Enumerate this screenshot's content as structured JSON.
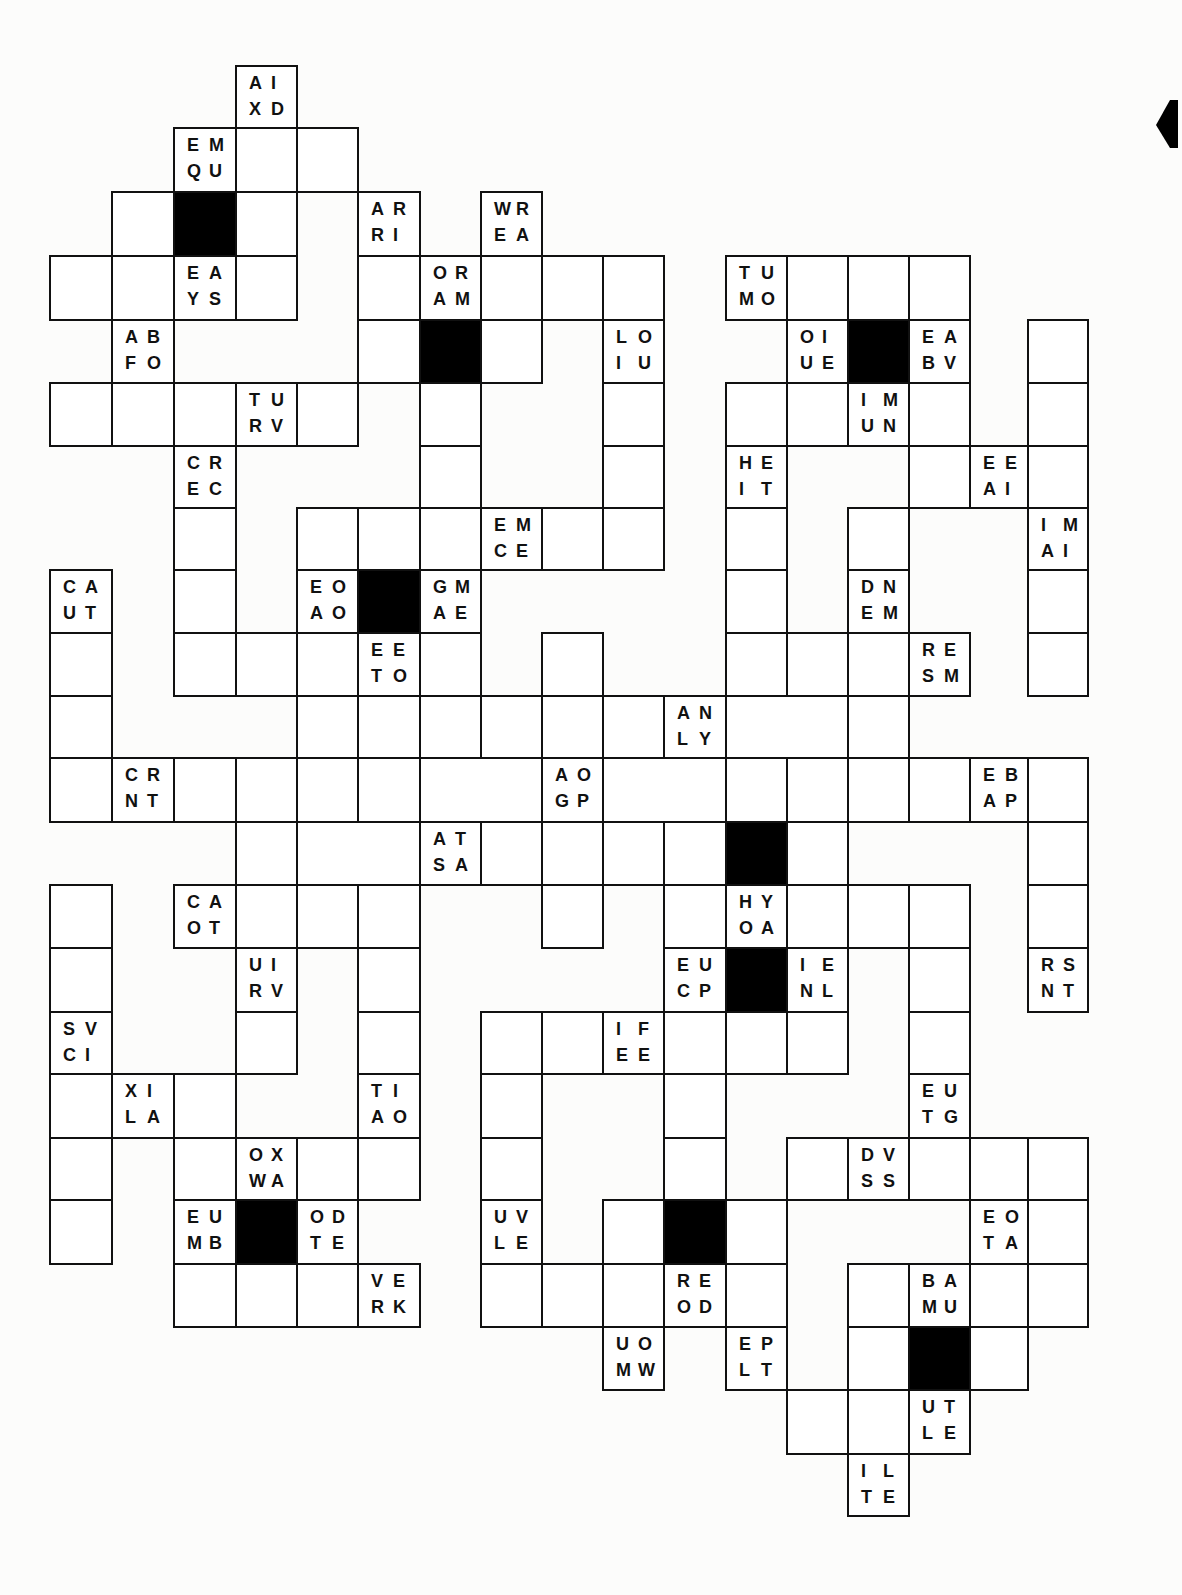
{
  "puzzle": {
    "colLines": [
      50,
      112,
      174,
      236,
      297,
      358,
      420,
      481,
      542,
      603,
      664,
      726,
      787,
      848,
      909,
      970,
      1028,
      1088
    ],
    "rowLines": [
      66,
      128,
      192,
      256,
      320,
      383,
      446,
      508,
      570,
      633,
      696,
      758,
      822,
      885,
      948,
      1012,
      1074,
      1138,
      1200,
      1264,
      1327,
      1390,
      1454,
      1516
    ],
    "cells": [
      {
        "c": 3,
        "r": 0,
        "t": "AIXD"
      },
      {
        "c": 2,
        "r": 1,
        "t": "EMQU"
      },
      {
        "c": 3,
        "r": 1
      },
      {
        "c": 4,
        "r": 1
      },
      {
        "c": 1,
        "r": 2
      },
      {
        "c": 2,
        "r": 2,
        "b": 1
      },
      {
        "c": 3,
        "r": 2
      },
      {
        "c": 5,
        "r": 2,
        "t": "ARRI"
      },
      {
        "c": 7,
        "r": 2,
        "t": "WREA"
      },
      {
        "c": 0,
        "r": 3
      },
      {
        "c": 1,
        "r": 3
      },
      {
        "c": 2,
        "r": 3,
        "t": "EAYS"
      },
      {
        "c": 3,
        "r": 3
      },
      {
        "c": 5,
        "r": 3
      },
      {
        "c": 6,
        "r": 3,
        "t": "ORAM"
      },
      {
        "c": 7,
        "r": 3
      },
      {
        "c": 8,
        "r": 3
      },
      {
        "c": 9,
        "r": 3
      },
      {
        "c": 11,
        "r": 3,
        "t": "TUMO"
      },
      {
        "c": 12,
        "r": 3
      },
      {
        "c": 13,
        "r": 3
      },
      {
        "c": 14,
        "r": 3
      },
      {
        "c": 1,
        "r": 4,
        "t": "ABFO"
      },
      {
        "c": 5,
        "r": 4
      },
      {
        "c": 6,
        "r": 4,
        "b": 1
      },
      {
        "c": 7,
        "r": 4
      },
      {
        "c": 9,
        "r": 4,
        "t": "LOIU"
      },
      {
        "c": 12,
        "r": 4,
        "t": "OIUE"
      },
      {
        "c": 13,
        "r": 4,
        "b": 1
      },
      {
        "c": 14,
        "r": 4,
        "t": "EABV"
      },
      {
        "c": 16,
        "r": 4
      },
      {
        "c": 0,
        "r": 5
      },
      {
        "c": 1,
        "r": 5
      },
      {
        "c": 2,
        "r": 5
      },
      {
        "c": 3,
        "r": 5,
        "t": "TURV"
      },
      {
        "c": 4,
        "r": 5
      },
      {
        "c": 6,
        "r": 5
      },
      {
        "c": 9,
        "r": 5
      },
      {
        "c": 11,
        "r": 5
      },
      {
        "c": 12,
        "r": 5
      },
      {
        "c": 13,
        "r": 5,
        "t": "IMUN"
      },
      {
        "c": 14,
        "r": 5
      },
      {
        "c": 16,
        "r": 5
      },
      {
        "c": 2,
        "r": 6,
        "t": "CREC"
      },
      {
        "c": 6,
        "r": 6
      },
      {
        "c": 9,
        "r": 6
      },
      {
        "c": 11,
        "r": 6,
        "t": "HEIT"
      },
      {
        "c": 14,
        "r": 6
      },
      {
        "c": 15,
        "r": 6,
        "t": "EEAI"
      },
      {
        "c": 16,
        "r": 6
      },
      {
        "c": 2,
        "r": 7
      },
      {
        "c": 4,
        "r": 7
      },
      {
        "c": 5,
        "r": 7
      },
      {
        "c": 6,
        "r": 7
      },
      {
        "c": 7,
        "r": 7,
        "t": "EMCE"
      },
      {
        "c": 8,
        "r": 7
      },
      {
        "c": 9,
        "r": 7
      },
      {
        "c": 11,
        "r": 7
      },
      {
        "c": 13,
        "r": 7
      },
      {
        "c": 16,
        "r": 7,
        "t": "IMAI"
      },
      {
        "c": 0,
        "r": 8,
        "t": "CAUT"
      },
      {
        "c": 2,
        "r": 8
      },
      {
        "c": 4,
        "r": 8,
        "t": "EOAO"
      },
      {
        "c": 5,
        "r": 8,
        "b": 1
      },
      {
        "c": 6,
        "r": 8,
        "t": "GMAE"
      },
      {
        "c": 11,
        "r": 8
      },
      {
        "c": 13,
        "r": 8,
        "t": "DNEM"
      },
      {
        "c": 16,
        "r": 8
      },
      {
        "c": 0,
        "r": 9
      },
      {
        "c": 2,
        "r": 9
      },
      {
        "c": 3,
        "r": 9
      },
      {
        "c": 4,
        "r": 9
      },
      {
        "c": 5,
        "r": 9,
        "t": "EETO"
      },
      {
        "c": 6,
        "r": 9
      },
      {
        "c": 8,
        "r": 9
      },
      {
        "c": 11,
        "r": 9
      },
      {
        "c": 12,
        "r": 9
      },
      {
        "c": 13,
        "r": 9
      },
      {
        "c": 14,
        "r": 9,
        "t": "RESM"
      },
      {
        "c": 16,
        "r": 9
      },
      {
        "c": 0,
        "r": 10
      },
      {
        "c": 4,
        "r": 10
      },
      {
        "c": 5,
        "r": 10
      },
      {
        "c": 6,
        "r": 10
      },
      {
        "c": 7,
        "r": 10
      },
      {
        "c": 8,
        "r": 10
      },
      {
        "c": 9,
        "r": 10
      },
      {
        "c": 10,
        "r": 10,
        "t": "ANLY"
      },
      {
        "c": 11,
        "r": 10,
        "w": 2
      },
      {
        "c": 13,
        "r": 10
      },
      {
        "c": 0,
        "r": 11
      },
      {
        "c": 1,
        "r": 11,
        "t": "CRNT"
      },
      {
        "c": 2,
        "r": 11
      },
      {
        "c": 3,
        "r": 11
      },
      {
        "c": 4,
        "r": 11
      },
      {
        "c": 5,
        "r": 11
      },
      {
        "c": 6,
        "r": 11,
        "w": 2
      },
      {
        "c": 8,
        "r": 11,
        "t": "AOGP"
      },
      {
        "c": 9,
        "r": 11,
        "w": 2
      },
      {
        "c": 11,
        "r": 11
      },
      {
        "c": 12,
        "r": 11
      },
      {
        "c": 13,
        "r": 11
      },
      {
        "c": 14,
        "r": 11
      },
      {
        "c": 15,
        "r": 11,
        "t": "EBAP"
      },
      {
        "c": 16,
        "r": 11
      },
      {
        "c": 3,
        "r": 12
      },
      {
        "c": 4,
        "r": 12,
        "w": 2
      },
      {
        "c": 6,
        "r": 12,
        "t": "ATSA"
      },
      {
        "c": 7,
        "r": 12
      },
      {
        "c": 8,
        "r": 12
      },
      {
        "c": 9,
        "r": 12
      },
      {
        "c": 10,
        "r": 12
      },
      {
        "c": 11,
        "r": 12,
        "b": 1
      },
      {
        "c": 12,
        "r": 12
      },
      {
        "c": 16,
        "r": 12
      },
      {
        "c": 0,
        "r": 13
      },
      {
        "c": 2,
        "r": 13,
        "t": "CAOT"
      },
      {
        "c": 3,
        "r": 13
      },
      {
        "c": 4,
        "r": 13
      },
      {
        "c": 5,
        "r": 13
      },
      {
        "c": 8,
        "r": 13
      },
      {
        "c": 10,
        "r": 13
      },
      {
        "c": 11,
        "r": 13,
        "t": "HYOA"
      },
      {
        "c": 12,
        "r": 13
      },
      {
        "c": 13,
        "r": 13
      },
      {
        "c": 14,
        "r": 13
      },
      {
        "c": 16,
        "r": 13
      },
      {
        "c": 0,
        "r": 14
      },
      {
        "c": 3,
        "r": 14,
        "t": "UIRV"
      },
      {
        "c": 5,
        "r": 14
      },
      {
        "c": 10,
        "r": 14,
        "t": "EUCP"
      },
      {
        "c": 11,
        "r": 14,
        "b": 1
      },
      {
        "c": 12,
        "r": 14,
        "t": "IENL"
      },
      {
        "c": 14,
        "r": 14
      },
      {
        "c": 16,
        "r": 14,
        "t": "RSNT"
      },
      {
        "c": 0,
        "r": 15,
        "t": "SVCI"
      },
      {
        "c": 3,
        "r": 15
      },
      {
        "c": 5,
        "r": 15
      },
      {
        "c": 7,
        "r": 15
      },
      {
        "c": 8,
        "r": 15
      },
      {
        "c": 9,
        "r": 15,
        "t": "IFEE"
      },
      {
        "c": 10,
        "r": 15
      },
      {
        "c": 11,
        "r": 15
      },
      {
        "c": 12,
        "r": 15
      },
      {
        "c": 14,
        "r": 15
      },
      {
        "c": 0,
        "r": 16
      },
      {
        "c": 1,
        "r": 16,
        "t": "XILA"
      },
      {
        "c": 2,
        "r": 16
      },
      {
        "c": 5,
        "r": 16,
        "t": "TIAO"
      },
      {
        "c": 7,
        "r": 16
      },
      {
        "c": 10,
        "r": 16
      },
      {
        "c": 14,
        "r": 16,
        "t": "EUTG"
      },
      {
        "c": 0,
        "r": 17
      },
      {
        "c": 2,
        "r": 17
      },
      {
        "c": 3,
        "r": 17,
        "t": "OXWA"
      },
      {
        "c": 4,
        "r": 17
      },
      {
        "c": 5,
        "r": 17
      },
      {
        "c": 7,
        "r": 17
      },
      {
        "c": 10,
        "r": 17
      },
      {
        "c": 12,
        "r": 17
      },
      {
        "c": 13,
        "r": 17,
        "t": "DVSS"
      },
      {
        "c": 14,
        "r": 17
      },
      {
        "c": 15,
        "r": 17
      },
      {
        "c": 16,
        "r": 17
      },
      {
        "c": 0,
        "r": 18
      },
      {
        "c": 2,
        "r": 18,
        "t": "EUMB"
      },
      {
        "c": 3,
        "r": 18,
        "b": 1
      },
      {
        "c": 4,
        "r": 18,
        "t": "ODTE"
      },
      {
        "c": 7,
        "r": 18,
        "t": "UVLE"
      },
      {
        "c": 9,
        "r": 18
      },
      {
        "c": 10,
        "r": 18,
        "b": 1
      },
      {
        "c": 11,
        "r": 18
      },
      {
        "c": 15,
        "r": 18,
        "t": "EOTA"
      },
      {
        "c": 16,
        "r": 18
      },
      {
        "c": 2,
        "r": 19
      },
      {
        "c": 3,
        "r": 19
      },
      {
        "c": 4,
        "r": 19
      },
      {
        "c": 5,
        "r": 19,
        "t": "VERK"
      },
      {
        "c": 7,
        "r": 19
      },
      {
        "c": 8,
        "r": 19
      },
      {
        "c": 9,
        "r": 19
      },
      {
        "c": 10,
        "r": 19,
        "t": "REOD"
      },
      {
        "c": 11,
        "r": 19
      },
      {
        "c": 13,
        "r": 19
      },
      {
        "c": 14,
        "r": 19,
        "t": "BAMU"
      },
      {
        "c": 15,
        "r": 19
      },
      {
        "c": 16,
        "r": 19
      },
      {
        "c": 9,
        "r": 20,
        "t": "UOMW"
      },
      {
        "c": 11,
        "r": 20,
        "t": "EPLT"
      },
      {
        "c": 13,
        "r": 20
      },
      {
        "c": 14,
        "r": 20,
        "b": 1
      },
      {
        "c": 15,
        "r": 20
      },
      {
        "c": 12,
        "r": 21
      },
      {
        "c": 13,
        "r": 21
      },
      {
        "c": 14,
        "r": 21,
        "t": "UTLE"
      },
      {
        "c": 13,
        "r": 22,
        "t": "ILTE"
      }
    ]
  }
}
